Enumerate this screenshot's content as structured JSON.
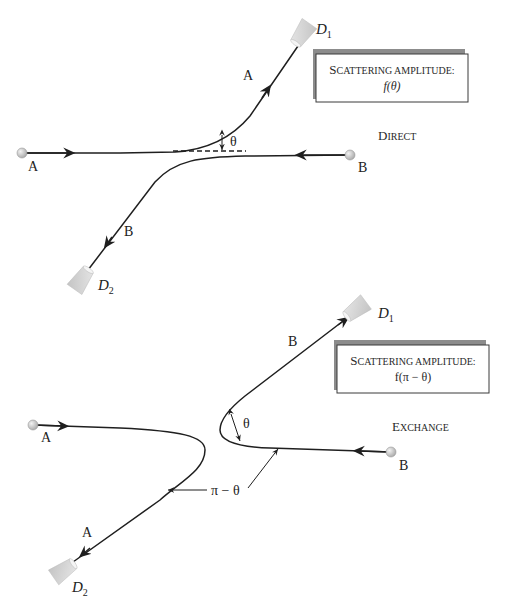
{
  "diagram": {
    "colors": {
      "line": "#1f1f1f",
      "detector": "#d4d4d4",
      "particle": "#c8c8c8",
      "box_shadow": "#8c8c8c"
    },
    "direct": {
      "panel_label_first": "D",
      "panel_label_rest": "IRECT",
      "box": {
        "line1_first": "S",
        "line1_rest": "CATTERING AMPLITUDE:",
        "line2": "f(θ)"
      },
      "particle_a_label": "A",
      "particle_b_label": "B",
      "outgoing_a_label": "A",
      "outgoing_b_label": "B",
      "detector_1": {
        "letter": "D",
        "sub": "1"
      },
      "detector_2": {
        "letter": "D",
        "sub": "2"
      },
      "angle_label": "θ"
    },
    "exchange": {
      "panel_label_first": "E",
      "panel_label_rest": "XCHANGE",
      "box": {
        "line1_first": "S",
        "line1_rest": "CATTERING AMPLITUDE:",
        "line2": "f(π − θ)"
      },
      "particle_a_label": "A",
      "particle_b_label": "B",
      "outgoing_a_label": "A",
      "outgoing_b_label": "B",
      "detector_1": {
        "letter": "D",
        "sub": "1"
      },
      "detector_2": {
        "letter": "D",
        "sub": "2"
      },
      "angle_label": "θ",
      "supplement_label": "π − θ"
    }
  }
}
